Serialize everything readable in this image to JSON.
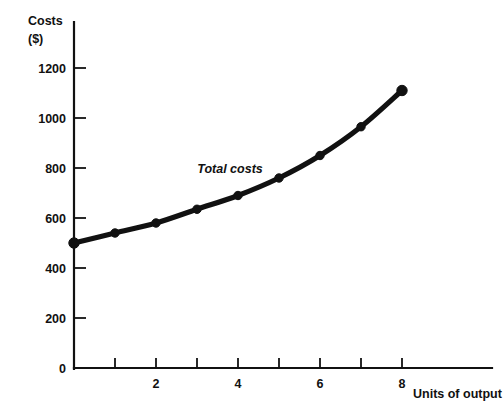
{
  "chart_data": {
    "type": "line",
    "title": "",
    "xlabel": "Units of output",
    "ylabel": "Costs\n($)",
    "ylabel_line1": "Costs",
    "ylabel_line2": "($)",
    "x": [
      0,
      1,
      2,
      3,
      4,
      5,
      6,
      7,
      8
    ],
    "values": [
      500,
      540,
      580,
      635,
      690,
      760,
      850,
      965,
      1110
    ],
    "series": [
      {
        "name": "Total costs",
        "values": [
          500,
          540,
          580,
          635,
          690,
          760,
          850,
          965,
          1110
        ]
      }
    ],
    "annotations": [
      {
        "text": "Total costs",
        "x": 3.1,
        "y": 800
      }
    ],
    "xlim": [
      0,
      9
    ],
    "ylim": [
      0,
      1300
    ],
    "xticks": [
      0,
      1,
      2,
      3,
      4,
      5,
      6,
      7,
      8
    ],
    "xtick_labels": [
      "",
      "",
      "2",
      "",
      "4",
      "",
      "6",
      "",
      "8"
    ],
    "yticks": [
      0,
      200,
      400,
      600,
      800,
      1000,
      1200
    ],
    "ytick_labels": [
      "0",
      "200",
      "400",
      "600",
      "800",
      "1000",
      "1200"
    ],
    "grid": false,
    "legend": "none",
    "marker": "circle",
    "line_color": "#111111",
    "marker_color": "#111111",
    "background_color": "#ffffff"
  }
}
